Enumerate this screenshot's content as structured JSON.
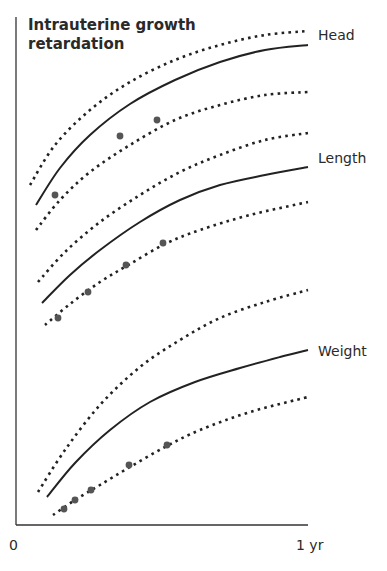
{
  "chart_data": {
    "type": "line",
    "title": "Intrauterine growth retardation",
    "title_lines": [
      "Intrauterine growth",
      "retardation"
    ],
    "xlabel": "",
    "ylabel": "",
    "x_ticks": [
      "0",
      "1 yr"
    ],
    "xlim": [
      0,
      1
    ],
    "grid": false,
    "legend": "inline labels at right end of curves",
    "line_color": "#222222",
    "dot_color": "#555555",
    "series": [
      {
        "name": "Head",
        "label": "Head",
        "center": [
          [
            36,
            205
          ],
          [
            60,
            168
          ],
          [
            90,
            135
          ],
          [
            130,
            104
          ],
          [
            175,
            80
          ],
          [
            220,
            62
          ],
          [
            265,
            50
          ],
          [
            308,
            45
          ]
        ],
        "upper": [
          [
            30,
            185
          ],
          [
            55,
            145
          ],
          [
            90,
            110
          ],
          [
            130,
            82
          ],
          [
            175,
            60
          ],
          [
            220,
            45
          ],
          [
            265,
            35
          ],
          [
            308,
            31
          ]
        ],
        "lower": [
          [
            36,
            230
          ],
          [
            60,
            200
          ],
          [
            90,
            172
          ],
          [
            130,
            145
          ],
          [
            175,
            120
          ],
          [
            220,
            105
          ],
          [
            265,
            95
          ],
          [
            308,
            92
          ]
        ],
        "points": [
          [
            55,
            195
          ],
          [
            120,
            136
          ],
          [
            157,
            120
          ]
        ]
      },
      {
        "name": "Length",
        "label": "Length",
        "center": [
          [
            42,
            303
          ],
          [
            70,
            275
          ],
          [
            100,
            250
          ],
          [
            140,
            222
          ],
          [
            180,
            200
          ],
          [
            220,
            185
          ],
          [
            265,
            175
          ],
          [
            308,
            167
          ]
        ],
        "upper": [
          [
            38,
            282
          ],
          [
            65,
            252
          ],
          [
            100,
            222
          ],
          [
            140,
            195
          ],
          [
            180,
            172
          ],
          [
            220,
            155
          ],
          [
            265,
            140
          ],
          [
            308,
            133
          ]
        ],
        "lower": [
          [
            45,
            325
          ],
          [
            70,
            304
          ],
          [
            100,
            282
          ],
          [
            130,
            264
          ],
          [
            165,
            244
          ],
          [
            200,
            230
          ],
          [
            250,
            215
          ],
          [
            308,
            202
          ]
        ],
        "points": [
          [
            58,
            318
          ],
          [
            88,
            292
          ],
          [
            126,
            265
          ],
          [
            163,
            243
          ]
        ]
      },
      {
        "name": "Weight",
        "label": "Weight",
        "center": [
          [
            47,
            497
          ],
          [
            75,
            463
          ],
          [
            110,
            430
          ],
          [
            150,
            402
          ],
          [
            195,
            382
          ],
          [
            240,
            368
          ],
          [
            280,
            357
          ],
          [
            308,
            350
          ]
        ],
        "upper": [
          [
            38,
            492
          ],
          [
            65,
            450
          ],
          [
            100,
            405
          ],
          [
            140,
            367
          ],
          [
            180,
            340
          ],
          [
            220,
            318
          ],
          [
            265,
            302
          ],
          [
            308,
            290
          ]
        ],
        "lower": [
          [
            53,
            515
          ],
          [
            75,
            500
          ],
          [
            100,
            485
          ],
          [
            130,
            467
          ],
          [
            165,
            447
          ],
          [
            200,
            430
          ],
          [
            250,
            412
          ],
          [
            308,
            397
          ]
        ],
        "points": [
          [
            64,
            509
          ],
          [
            75,
            500
          ],
          [
            91,
            490
          ],
          [
            129,
            465
          ],
          [
            167,
            445
          ]
        ]
      }
    ]
  },
  "labels": {
    "title_line1": "Intrauterine growth",
    "title_line2": "retardation",
    "head": "Head",
    "length": "Length",
    "weight": "Weight",
    "x_start": "0",
    "x_end": "1 yr"
  }
}
